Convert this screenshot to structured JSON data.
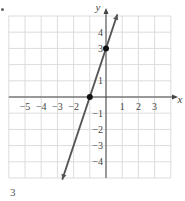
{
  "chart_data": {
    "type": "line",
    "title": "",
    "xlabel": "x",
    "ylabel": "y",
    "xlim": [
      -6,
      6
    ],
    "ylim": [
      -5,
      5
    ],
    "grid": true,
    "x_ticks": [
      -5,
      -4,
      -3,
      -2,
      1,
      2,
      3
    ],
    "y_ticks": [
      4,
      3,
      1,
      -1,
      -2,
      -3,
      -4
    ],
    "series": [
      {
        "name": "y = 3x + 3",
        "equation": "y = 3x + 3",
        "slope": 3,
        "intercept": 3,
        "x": [
          -2.7,
          0.7
        ],
        "y": [
          -5.1,
          5.1
        ],
        "color": "#555555"
      }
    ],
    "points": [
      {
        "label": "x-intercept",
        "x": -1,
        "y": 0
      },
      {
        "label": "y-intercept",
        "x": 0,
        "y": 3
      }
    ]
  },
  "page_number": "3"
}
